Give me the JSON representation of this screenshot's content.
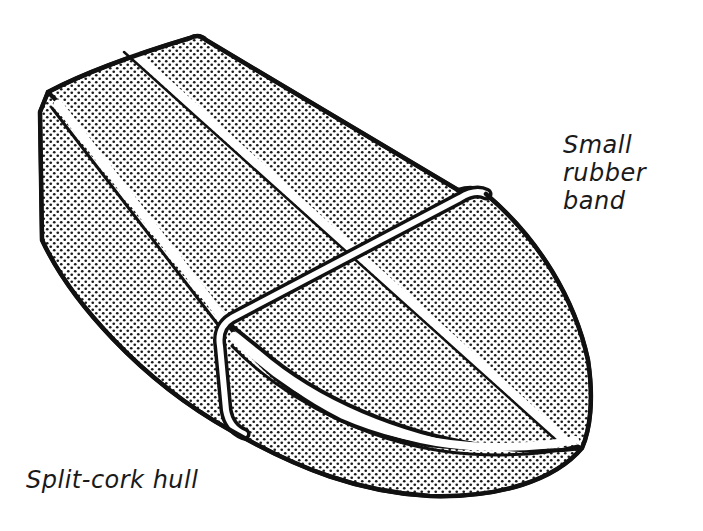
{
  "figure": {
    "style": "black line art with halftone dot shading"
  },
  "labels": {
    "rubber_band": {
      "lines": [
        "Small",
        "rubber",
        "band"
      ]
    },
    "hull": "Split-cork hull"
  },
  "colors": {
    "ink": "#111111",
    "paper": "#ffffff",
    "halftone_dot": "#1a1a1a"
  }
}
